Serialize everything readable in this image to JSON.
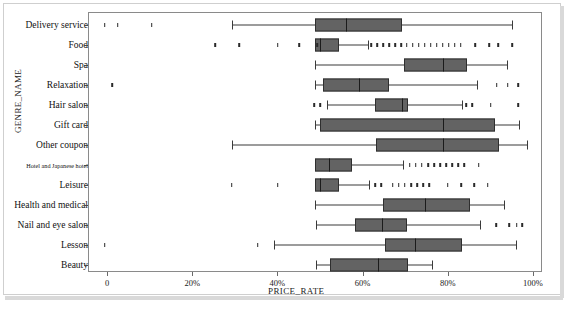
{
  "chart_data": {
    "type": "box",
    "title": "",
    "xlabel": "PRICE_RATE",
    "ylabel": "GENRE_NAME",
    "xlim": [
      0,
      100
    ],
    "x_unit": "%",
    "grid": false,
    "legend": "none",
    "xticks": [
      {
        "value": 0,
        "label": "0"
      },
      {
        "value": 20,
        "label": "20%"
      },
      {
        "value": 40,
        "label": "40%"
      },
      {
        "value": 60,
        "label": "60%"
      },
      {
        "value": 80,
        "label": "80%"
      },
      {
        "value": 100,
        "label": "100%"
      }
    ],
    "categories": [
      "Delivery service",
      "Food",
      "Spa",
      "Relaxation",
      "Hair salon",
      "Gift card",
      "Other coupon",
      "Hotel and Japanese hotel",
      "Leisure",
      "Health and medical",
      "Nail and eye salon",
      "Lesson",
      "Beauty"
    ],
    "boxes": [
      {
        "category": "Delivery service",
        "whisker_low": 29.3,
        "q1": 48.8,
        "median": 56.1,
        "q3": 69.2,
        "whisker_high": 95.1,
        "outliers": [
          -0.5,
          2.5,
          10.5
        ]
      },
      {
        "category": "Food",
        "whisker_low": 48.8,
        "q1": 48.8,
        "median": 50.0,
        "q3": 54.5,
        "whisker_high": 61.3,
        "outliers": [
          25.4,
          31.0,
          40.1,
          45.1,
          49.3,
          62.0,
          63.4,
          64.8,
          66.2,
          67.6,
          69.0,
          70.4,
          71.8,
          73.2,
          74.6,
          76.0,
          77.4,
          78.8,
          80.2,
          81.6,
          83.0,
          86.4,
          89.7,
          91.8,
          95.1
        ]
      },
      {
        "category": "Spa",
        "whisker_low": 48.8,
        "q1": 69.7,
        "median": 78.9,
        "q3": 84.5,
        "whisker_high": 93.9,
        "outliers": []
      },
      {
        "category": "Relaxation",
        "whisker_low": 48.8,
        "q1": 50.7,
        "median": 59.2,
        "q3": 66.2,
        "whisker_high": 86.9,
        "outliers": [
          1.2,
          91.5,
          94.1,
          96.5
        ]
      },
      {
        "category": "Hair salon",
        "whisker_low": 51.6,
        "q1": 62.9,
        "median": 69.2,
        "q3": 70.7,
        "whisker_high": 83.3,
        "outliers": [
          48.6,
          50.0,
          84.3,
          85.7,
          90.1,
          96.5
        ]
      },
      {
        "category": "Gift card",
        "whisker_low": 48.8,
        "q1": 50.0,
        "median": 78.9,
        "q3": 91.1,
        "whisker_high": 96.7,
        "outliers": []
      },
      {
        "category": "Other coupon",
        "whisker_low": 29.3,
        "q1": 63.1,
        "median": 78.9,
        "q3": 92.0,
        "whisker_high": 98.6,
        "outliers": []
      },
      {
        "category": "Hotel and Japanese hotel",
        "whisker_low": 48.8,
        "q1": 48.8,
        "median": 52.0,
        "q3": 57.5,
        "whisker_high": 69.5,
        "outliers": [
          71.1,
          72.5,
          73.9,
          75.4,
          76.8,
          78.2,
          79.6,
          81.0,
          82.4,
          83.8,
          87.3
        ]
      },
      {
        "category": "Leisure",
        "whisker_low": 48.8,
        "q1": 48.8,
        "median": 50.0,
        "q3": 54.5,
        "whisker_high": 61.5,
        "outliers": [
          29.3,
          40.1,
          62.9,
          64.3,
          67.1,
          68.5,
          69.9,
          71.4,
          72.8,
          74.2,
          75.6,
          80.0,
          83.1,
          86.2,
          89.4
        ]
      },
      {
        "category": "Health and medical",
        "whisker_low": 48.8,
        "q1": 64.9,
        "median": 74.6,
        "q3": 85.2,
        "whisker_high": 93.2,
        "outliers": []
      },
      {
        "category": "Nail and eye salon",
        "whisker_low": 49.1,
        "q1": 58.2,
        "median": 64.5,
        "q3": 70.4,
        "whisker_high": 87.6,
        "outliers": [
          91.3,
          94.4,
          96.2,
          97.4
        ]
      },
      {
        "category": "Lesson",
        "whisker_low": 39.2,
        "q1": 65.3,
        "median": 72.3,
        "q3": 83.3,
        "whisker_high": 96.0,
        "outliers": [
          -0.5,
          35.4
        ]
      },
      {
        "category": "Beauty",
        "whisker_low": 49.1,
        "q1": 52.3,
        "median": 63.6,
        "q3": 70.7,
        "whisker_high": 76.3,
        "outliers": []
      }
    ],
    "style": {
      "box_fill": "#636363",
      "box_edge": "#2f2f2f",
      "whisker_color": "#3a3a3a",
      "median_color": "#1b1b1b",
      "outlier_color": "#2a2a2a",
      "axis_color": "#8a8a8a",
      "background": "#ffffff"
    }
  }
}
